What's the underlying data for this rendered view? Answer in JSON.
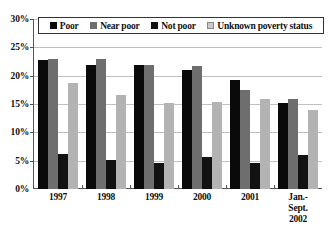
{
  "chart_data": {
    "type": "bar",
    "title": "",
    "xlabel": "",
    "ylabel": "",
    "ylim": [
      0,
      30
    ],
    "ytick_labels": [
      "0%",
      "5%",
      "10%",
      "15%",
      "20%",
      "25%",
      "30%"
    ],
    "ytick_values": [
      0,
      5,
      10,
      15,
      20,
      25,
      30
    ],
    "grid": true,
    "legend_position": "top-inside",
    "categories": [
      "1997",
      "1998",
      "1999",
      "2000",
      "2001",
      "Jan.-Sept. 2002"
    ],
    "category_lines": [
      [
        "1997"
      ],
      [
        "1998"
      ],
      [
        "1999"
      ],
      [
        "2000"
      ],
      [
        "2001"
      ],
      [
        "Jan.-",
        "Sept.",
        "2002"
      ]
    ],
    "series": [
      {
        "name": "Poor",
        "color": "#0a0a0a",
        "values": [
          22.8,
          21.9,
          21.8,
          21.0,
          19.3,
          15.2
        ]
      },
      {
        "name": "Near poor",
        "color": "#6e6e6e",
        "values": [
          23.0,
          22.9,
          21.9,
          21.7,
          17.4,
          15.8
        ]
      },
      {
        "name": "Not poor",
        "color": "#121212",
        "values": [
          6.1,
          5.2,
          4.6,
          5.7,
          4.6,
          6.0
        ]
      },
      {
        "name": "Unknown poverty status",
        "color": "#b3b3b3",
        "values": [
          18.7,
          16.6,
          15.1,
          15.4,
          15.8,
          14.0
        ]
      }
    ]
  },
  "legend": {
    "items": [
      {
        "label": "Poor"
      },
      {
        "label": "Near poor"
      },
      {
        "label": "Not poor"
      },
      {
        "label": "Unknown poverty status"
      }
    ]
  }
}
